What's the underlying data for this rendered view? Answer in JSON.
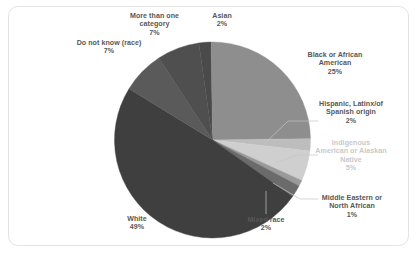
{
  "chart_data": {
    "type": "pie",
    "title": "",
    "xlabel": "",
    "ylabel": "",
    "legend_position": "none",
    "grid": false,
    "units": "percent",
    "categories": [
      "Asian",
      "Black or African American",
      "Hispanic, Latinx/of Spanish origin",
      "Indigenous American or Alaskan Native",
      "Middle Eastern or North African",
      "Mixed race",
      "White",
      "Do not know (race)",
      "More than one category"
    ],
    "values": [
      2,
      25,
      2,
      5,
      1,
      2,
      49,
      7,
      7
    ],
    "slices": [
      {
        "label": "Asian",
        "value": 2,
        "pct_text": "2%",
        "color": "#4a4a4a",
        "start_deg": -8,
        "sweep_deg": 7.2
      },
      {
        "label": "Black or African American",
        "value": 25,
        "pct_text": "25%",
        "color": "#8e8e8e",
        "start_deg": -0.8,
        "sweep_deg": 90
      },
      {
        "label": "Hispanic, Latinx/of Spanish origin",
        "value": 2,
        "pct_text": "2%",
        "color": "#bdbdbd",
        "start_deg": 89.2,
        "sweep_deg": 7.2
      },
      {
        "label": "Indigenous American or Alaskan Native",
        "value": 5,
        "pct_text": "5%",
        "color": "#cfcfcf",
        "start_deg": 96.4,
        "sweep_deg": 18
      },
      {
        "label": "Middle Eastern or North African",
        "value": 1,
        "pct_text": "1%",
        "color": "#9a9a9a",
        "start_deg": 114.4,
        "sweep_deg": 3.6
      },
      {
        "label": "Mixed race",
        "value": 2,
        "pct_text": "2%",
        "color": "#6b6b6b",
        "start_deg": 118,
        "sweep_deg": 7.2
      },
      {
        "label": "White",
        "value": 49,
        "pct_text": "49%",
        "color": "#3f3f3f",
        "start_deg": 125.2,
        "sweep_deg": 176.4
      },
      {
        "label": "Do not know (race)",
        "value": 7,
        "pct_text": "7%",
        "color": "#5a5a5a",
        "start_deg": 301.6,
        "sweep_deg": 25.2
      },
      {
        "label": "More than one category",
        "value": 7,
        "pct_text": "7%",
        "color": "#4f4f4f",
        "start_deg": 326.8,
        "sweep_deg": 25.2
      }
    ]
  },
  "labels": {
    "more_than_one": {
      "line1": "More than one",
      "line2": "category",
      "pct": "7%"
    },
    "asian": {
      "line1": "Asian",
      "pct": "2%"
    },
    "do_not_know": {
      "line1": "Do not know (race)",
      "pct": "7%"
    },
    "black": {
      "line1": "Black or African",
      "line2": "American",
      "pct": "25%"
    },
    "hispanic": {
      "line1": "Hispanic, Latinx/of",
      "line2": "Spanish origin",
      "pct": "2%"
    },
    "indigenous": {
      "line1": "Indigenous",
      "line2": "American or Alaskan",
      "line3": "Native",
      "pct": "5%"
    },
    "middle_eastern": {
      "line1": "Middle Eastern or",
      "line2": "North African",
      "pct": "1%"
    },
    "mixed_race": {
      "line1": "Mixed race",
      "pct": "2%"
    },
    "white": {
      "line1": "White",
      "pct": "49%"
    }
  },
  "colors": {
    "text": "#575757",
    "faint_text": "#c9c9c9",
    "card_border": "#e3e3e3",
    "background": "#ffffff",
    "leader_line": "#c4c4c4"
  }
}
